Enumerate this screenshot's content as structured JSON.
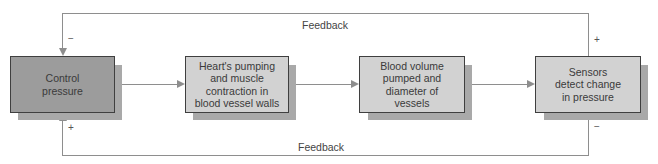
{
  "diagram": {
    "type": "feedback-loop flowchart",
    "nodes": [
      {
        "id": "control",
        "label": "Control pressure",
        "lines": [
          "Control",
          "pressure"
        ]
      },
      {
        "id": "heart",
        "label": "Heart's pumping and muscle contraction in blood vessel walls",
        "lines": [
          "Heart's pumping",
          "and muscle",
          "contraction in",
          "blood vessel walls"
        ]
      },
      {
        "id": "volume",
        "label": "Blood volume pumped and diameter of vessels",
        "lines": [
          "Blood volume",
          "pumped and",
          "diameter of",
          "vessels"
        ]
      },
      {
        "id": "sensors",
        "label": "Sensors detect change in pressure",
        "lines": [
          "Sensors",
          "detect change",
          "in pressure"
        ]
      }
    ],
    "edges": [
      {
        "from": "control",
        "to": "heart"
      },
      {
        "from": "heart",
        "to": "volume"
      },
      {
        "from": "volume",
        "to": "sensors"
      },
      {
        "from": "sensors",
        "to": "control",
        "route": "top",
        "label": "Feedback",
        "sign_start": "+",
        "sign_end": "−"
      },
      {
        "from": "sensors",
        "to": "control",
        "route": "bottom",
        "label": "Feedback",
        "sign_start": "−",
        "sign_end": "+"
      }
    ],
    "feedback_top_label": "Feedback",
    "feedback_bottom_label": "Feedback",
    "signs": {
      "top_left": "−",
      "top_right": "+",
      "bottom_left": "+",
      "bottom_right": "−"
    },
    "colors": {
      "control_box": "#9c9c9c",
      "other_boxes": "#d2d2d2",
      "shadow": "#a9a9a9",
      "lines": "#8e8e8e",
      "border": "#3f3f3f"
    }
  }
}
